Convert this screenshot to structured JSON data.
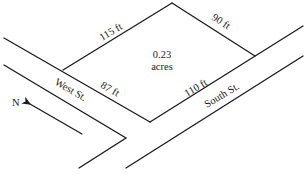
{
  "diagram": {
    "type": "lot-plan",
    "lot": {
      "area_value": "0.23",
      "area_unit": "acres",
      "sides": {
        "northwest": "115 ft",
        "northeast": "90 ft",
        "southwest": "87 ft",
        "southeast": "110 ft"
      }
    },
    "streets": {
      "west": "West St.",
      "south": "South St."
    },
    "compass": {
      "label": "N"
    }
  }
}
